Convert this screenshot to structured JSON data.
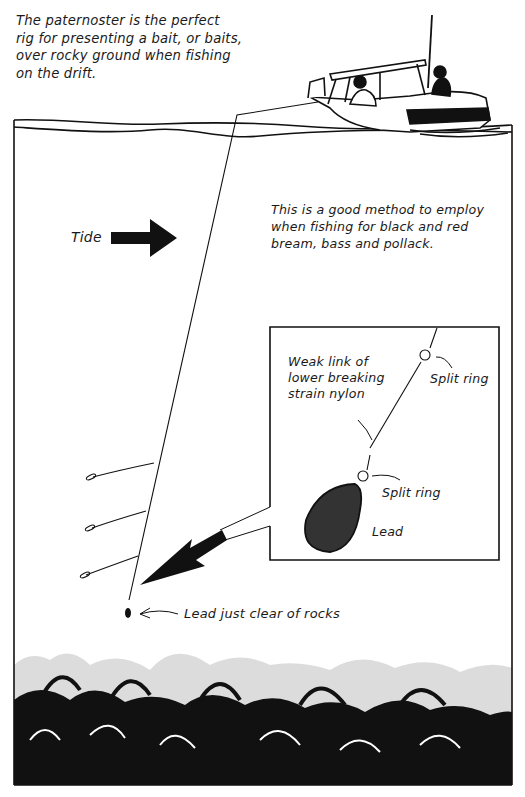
{
  "diagram": {
    "intro_text": "The paternoster is the perfect\nrig for presenting a bait, or baits,\nover rocky ground when fishing\non the drift.",
    "method_text": "This is a good method to employ\nwhen fishing for black and red\nbream, bass and pollack.",
    "tide_label": "Tide",
    "inset": {
      "weak_link_label": "Weak link of\nlower breaking\nstrain nylon",
      "split_ring_top_label": "Split ring",
      "split_ring_bottom_label": "Split ring",
      "lead_label": "Lead"
    },
    "lead_clear_label": "Lead just clear of rocks",
    "elements": [
      "boat",
      "anglers",
      "water-surface",
      "fishing-line",
      "hooks",
      "lead-weight",
      "tide-arrow",
      "inset-detail",
      "pointer-arrow",
      "rocky-seabed"
    ],
    "hook_count": 3,
    "colors": {
      "ink": "#111111",
      "paper": "#ffffff"
    }
  }
}
